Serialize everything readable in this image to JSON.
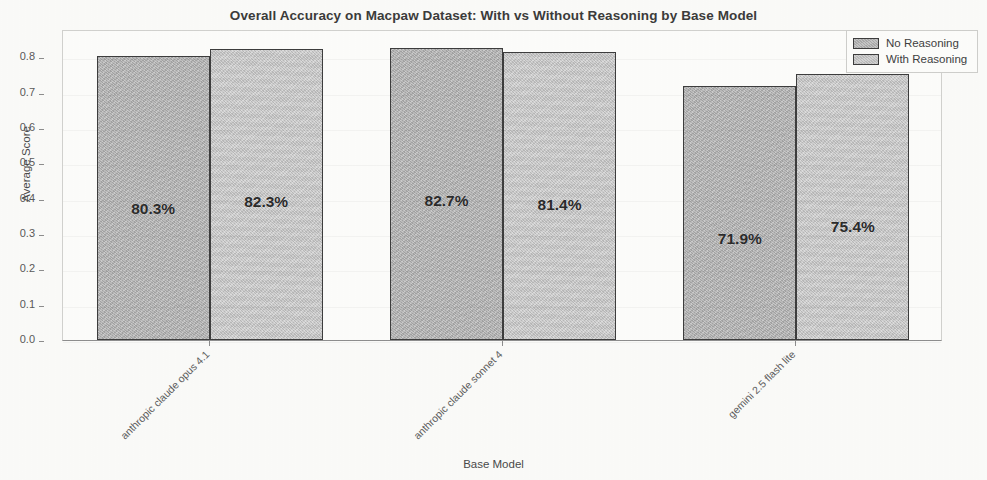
{
  "chart_data": {
    "type": "bar",
    "title": "Overall Accuracy on Macpaw Dataset: With vs Without Reasoning by Base Model",
    "xlabel": "Base Model",
    "ylabel": "Average Score",
    "categories": [
      "anthropic claude opus 4.1",
      "anthropic claude sonnet 4",
      "gemini 2.5 flash lite"
    ],
    "series": [
      {
        "name": "No Reasoning",
        "color": "#b3b3b3",
        "values": [
          0.803,
          0.827,
          0.719
        ],
        "labels": [
          "80.3%",
          "82.7%",
          "71.9%"
        ]
      },
      {
        "name": "With Reasoning",
        "color": "#c6c6c6",
        "values": [
          0.823,
          0.814,
          0.754
        ],
        "labels": [
          "82.3%",
          "81.4%",
          "75.4%"
        ]
      }
    ],
    "ylim": [
      0.0,
      0.88
    ],
    "yticks": [
      "0.0",
      "0.1",
      "0.2",
      "0.3",
      "0.4",
      "0.5",
      "0.6",
      "0.7",
      "0.8"
    ],
    "grid": false,
    "legend_position": "upper right"
  },
  "legend": {
    "entries": [
      {
        "label": "No Reasoning"
      },
      {
        "label": "With Reasoning"
      }
    ]
  }
}
